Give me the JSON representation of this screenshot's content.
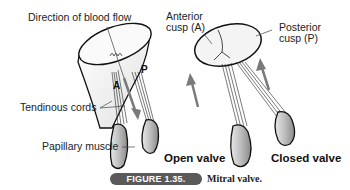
{
  "labels": {
    "blood_flow": "Direction of blood flow",
    "anterior_cusp_line1": "Anterior",
    "anterior_cusp_line2": "cusp (A)",
    "posterior_cusp_line1": "Posterior",
    "posterior_cusp_line2": "cusp (P)",
    "tendinous_cords": "Tendinous cords",
    "papillary_muscle": "Papillary muscle",
    "cusp_a_marker": "A",
    "cusp_p_marker": "P"
  },
  "panels": {
    "open": {
      "title": "Open valve"
    },
    "closed": {
      "title": "Closed valve"
    }
  },
  "caption": {
    "figure_label": "FIGURE 1.35.",
    "text": "Mitral valve."
  },
  "colors": {
    "outline": "#111111",
    "muscle_fill": "#c8c8c8",
    "arrow": "#7a7a7a",
    "badge": "#5a5a5a"
  }
}
